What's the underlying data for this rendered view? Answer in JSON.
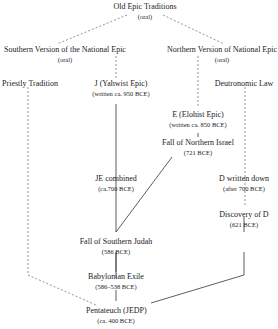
{
  "nodes": {
    "old_epic": {
      "title": "Old Epic Traditions",
      "sub": "(oral)"
    },
    "southern": {
      "title": "Southern Version of the National Epic",
      "sub": "(oral)"
    },
    "northern": {
      "title": "Northern Version of National Epic",
      "sub": "(oral)"
    },
    "priestly": {
      "title": "Priestly Tradition"
    },
    "j": {
      "title": "J (Yahwist Epic)",
      "sub": "(written ca. 950 BCE)"
    },
    "deut_law": {
      "title": "Deutronomic Law"
    },
    "e": {
      "title": "E (Elohist Epic)",
      "sub": "(written ca. 850 BCE)"
    },
    "fall_north": {
      "title": "Fall of Northern Israel",
      "sub": "(721 BCE)"
    },
    "je": {
      "title": "JE combined",
      "sub": "(ca.700 BCE)"
    },
    "d_written": {
      "title": "D written down",
      "sub": "(after 700 BCE)"
    },
    "discovery_d": {
      "title": "Discovery of D",
      "sub": "(621 BCE)"
    },
    "fall_south": {
      "title": "Fall of Southern Judah",
      "sub": "(586 BCE)"
    },
    "exile": {
      "title": "Babylonian Exile",
      "sub": "(586–538 BCE)"
    },
    "pentateuch": {
      "title": "Pentateuch (JEDP)",
      "sub": "(ca. 400 BCE)"
    }
  },
  "legend": {
    "dashed": "oral / undocumented transmission",
    "solid": "written transmission"
  }
}
